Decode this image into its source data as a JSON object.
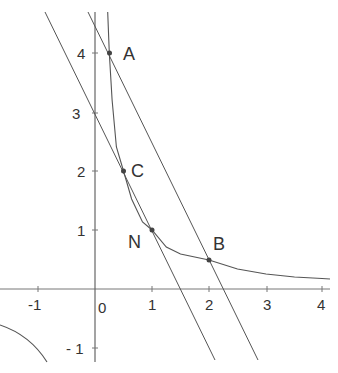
{
  "diagram": {
    "type": "function-graph",
    "curve": "y = 1/x",
    "x_ticks": [
      "-1",
      "0",
      "1",
      "2",
      "3",
      "4"
    ],
    "y_ticks": [
      "4",
      "3",
      "2",
      "1",
      "- 1"
    ],
    "points": [
      {
        "label": "A",
        "x": 0.25,
        "y": 4
      },
      {
        "label": "C",
        "x": 0.5,
        "y": 2
      },
      {
        "label": "N",
        "x": 1,
        "y": 1
      },
      {
        "label": "B",
        "x": 2,
        "y": 0.5
      }
    ],
    "lines": [
      {
        "name": "AB",
        "equation": "y = -2x + 4.5"
      },
      {
        "name": "CN",
        "equation": "y = -2x + 3"
      }
    ],
    "colors": {
      "stroke": "#555555",
      "point": "#444444",
      "text": "#333333"
    }
  }
}
